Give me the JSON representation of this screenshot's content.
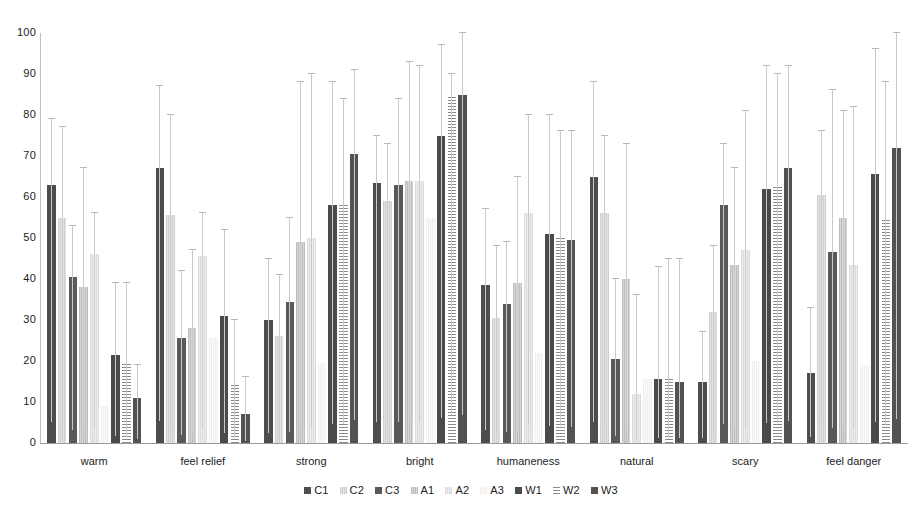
{
  "chart_data": {
    "type": "bar",
    "title": "",
    "subtitle": "",
    "xlabel": "",
    "ylabel": "",
    "ylim": [
      0,
      100
    ],
    "yticks": [
      0,
      10,
      20,
      30,
      40,
      50,
      60,
      70,
      80,
      90,
      100
    ],
    "grid": false,
    "legend_position": "bottom",
    "error_bars": "upper whisker with cap",
    "categories": [
      "warm",
      "feel relief",
      "strong",
      "bright",
      "humaneness",
      "natural",
      "scary",
      "feel danger"
    ],
    "series": [
      {
        "name": "C1",
        "color": "#4d4d4d",
        "pattern": "solid-dark",
        "values": [
          63,
          67,
          30,
          63.5,
          38.5,
          65,
          15,
          17
        ],
        "err_upper": [
          79,
          87,
          45,
          75,
          57,
          88,
          27,
          33
        ]
      },
      {
        "name": "C2",
        "color": "#cfcfcf",
        "pattern": "fine-vertical-light",
        "values": [
          55,
          55.5,
          26,
          59,
          30.5,
          56,
          32,
          60.5
        ],
        "err_upper": [
          77,
          80,
          41,
          73,
          48,
          75,
          48,
          76
        ]
      },
      {
        "name": "C3",
        "color": "#595959",
        "pattern": "solid-dark",
        "values": [
          40.5,
          25.5,
          34.5,
          63,
          34,
          20.5,
          58,
          46.5
        ],
        "err_upper": [
          53,
          42,
          55,
          84,
          49,
          40,
          73,
          86
        ]
      },
      {
        "name": "A1",
        "color": "#bdbdbd",
        "pattern": "fine-vertical-medium",
        "values": [
          38,
          28,
          49,
          64,
          39,
          40,
          43.5,
          55
        ],
        "err_upper": [
          67,
          47,
          88,
          93,
          65,
          73,
          67,
          81
        ]
      },
      {
        "name": "A2",
        "color": "#dcdcdc",
        "pattern": "fine-vertical-light",
        "values": [
          46,
          45.5,
          50,
          64,
          56,
          12,
          47,
          43.5
        ],
        "err_upper": [
          56,
          56,
          90,
          92,
          80,
          36,
          81,
          82
        ]
      },
      {
        "name": "A3",
        "color": "#f0f0f0",
        "pattern": "fine-vertical-very-light",
        "values": [
          9,
          25.5,
          19.5,
          55,
          22,
          15.5,
          20,
          19
        ]
      },
      {
        "name": "W1",
        "color": "#4a4a4a",
        "pattern": "solid-dark",
        "values": [
          21.5,
          31,
          58,
          75,
          51,
          15.5,
          62,
          65.5
        ],
        "err_upper": [
          39,
          52,
          88,
          97,
          80,
          43,
          92,
          96
        ]
      },
      {
        "name": "W2",
        "color": "#8a8a8a",
        "pattern": "horizontal-hatch",
        "values": [
          19.5,
          14.5,
          58.5,
          85,
          50.5,
          15.5,
          62.5,
          55
        ],
        "err_upper": [
          39,
          30,
          84,
          90,
          76,
          45,
          90,
          88
        ]
      },
      {
        "name": "W3",
        "color": "#525252",
        "pattern": "solid-dark",
        "values": [
          11,
          7,
          70.5,
          85,
          49.5,
          15,
          67,
          72
        ],
        "err_upper": [
          19,
          16,
          91,
          100,
          76,
          45,
          92,
          100
        ]
      }
    ]
  },
  "axis": {
    "y_tick_labels": [
      "100",
      "90",
      "80",
      "70",
      "60",
      "50",
      "40",
      "30",
      "20",
      "10",
      "0"
    ]
  },
  "legend": {
    "items": [
      {
        "label": "C1"
      },
      {
        "label": "C2"
      },
      {
        "label": "C3"
      },
      {
        "label": "A1"
      },
      {
        "label": "A2"
      },
      {
        "label": "A3"
      },
      {
        "label": "W1"
      },
      {
        "label": "W2"
      },
      {
        "label": "W3"
      }
    ]
  }
}
